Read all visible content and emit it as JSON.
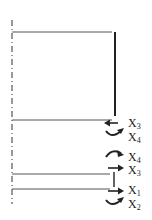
{
  "diagram": {
    "labels": [
      {
        "id": "l1",
        "text": "X",
        "sub": "3",
        "x": 128,
        "y": 117
      },
      {
        "id": "l2",
        "text": "X",
        "sub": "4",
        "x": 128,
        "y": 131
      },
      {
        "id": "l3",
        "text": "X",
        "sub": "4",
        "x": 128,
        "y": 151
      },
      {
        "id": "l4",
        "text": "X",
        "sub": "3",
        "x": 128,
        "y": 164
      },
      {
        "id": "l5",
        "text": "X",
        "sub": "1",
        "x": 128,
        "y": 184
      },
      {
        "id": "l6",
        "text": "X",
        "sub": "2",
        "x": 128,
        "y": 198
      }
    ],
    "arrows": [
      {
        "label": "X3",
        "type": "straight-left"
      },
      {
        "label": "X4",
        "type": "curved-right-down"
      },
      {
        "label": "X4",
        "type": "curved-right-up"
      },
      {
        "label": "X3",
        "type": "straight-right"
      },
      {
        "label": "X1",
        "type": "straight-right"
      },
      {
        "label": "X2",
        "type": "curved-right-down"
      }
    ],
    "colors": {
      "line": "#333333",
      "axis": "#555555"
    }
  }
}
